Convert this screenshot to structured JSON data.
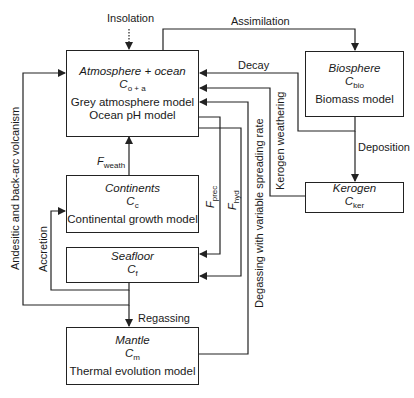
{
  "diagram": {
    "boxes": {
      "atmosphere": {
        "title": "Atmosphere + ocean",
        "symbol": "C",
        "subscript": "o + a",
        "lines": [
          "Grey atmosphere model",
          "Ocean pH model"
        ]
      },
      "biosphere": {
        "title": "Biosphere",
        "symbol": "C",
        "subscript": "bio",
        "lines": [
          "Biomass model"
        ]
      },
      "kerogen": {
        "title": "Kerogen",
        "symbol": "C",
        "subscript": "ker"
      },
      "continents": {
        "title": "Continents",
        "symbol": "C",
        "subscript": "c",
        "lines": [
          "Continental growth model"
        ]
      },
      "seafloor": {
        "title": "Seafloor",
        "symbol": "C",
        "subscript": "f"
      },
      "mantle": {
        "title": "Mantle",
        "symbol": "C",
        "subscript": "m",
        "lines": [
          "Thermal evolution model"
        ]
      }
    },
    "arrows": {
      "insolation": "Insolation",
      "assimilation": "Assimilation",
      "decay": "Decay",
      "deposition": "Deposition",
      "kerogen_weathering": "Kerogen weathering",
      "degassing": "Degassing with variable spreading rate",
      "f_prec": {
        "symbol": "F",
        "subscript": "prec"
      },
      "f_hyd": {
        "symbol": "F",
        "subscript": "hyd"
      },
      "f_weath": {
        "symbol": "F",
        "subscript": "weath"
      },
      "accretion": "Accretion",
      "andesitic": "Andesitic and back-arc volcanism",
      "regassing": "Regassing"
    },
    "colors": {
      "line": "#222222",
      "background": "#ffffff"
    }
  }
}
